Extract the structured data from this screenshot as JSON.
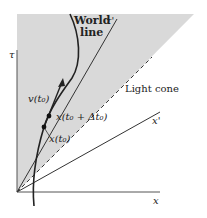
{
  "diagram": {
    "title": "",
    "labels": {
      "tau_axis": "τ",
      "x_axis": "x",
      "tau_prime": "τ'",
      "x_prime": "x'",
      "world_line_1": "World",
      "world_line_2": "line",
      "light_cone": "Light cone",
      "velocity": "v(t₀)",
      "point_t0": "x(t₀)",
      "point_t0_dt": "x(t₀ + Δt₀)"
    },
    "colors": {
      "shade": "#d9d9d9",
      "line": "#222222",
      "background": "#ffffff"
    }
  }
}
